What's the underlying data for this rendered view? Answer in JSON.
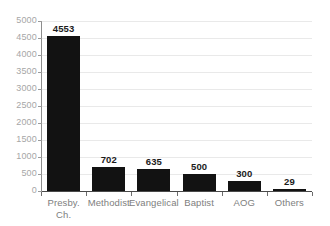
{
  "chart_data": {
    "type": "bar",
    "title": "",
    "xlabel": "",
    "ylabel": "",
    "categories": [
      "Presby. Ch.",
      "Methodist",
      "Evangelical",
      "Baptist",
      "AOG",
      "Others"
    ],
    "category_lines": [
      [
        "Presby.",
        "Ch."
      ],
      [
        "Methodist"
      ],
      [
        "Evangelical"
      ],
      [
        "Baptist"
      ],
      [
        "AOG"
      ],
      [
        "Others"
      ]
    ],
    "values": [
      4553,
      702,
      635,
      500,
      300,
      29
    ],
    "value_labels": [
      "4553",
      "702",
      "635",
      "500",
      "300",
      "29"
    ],
    "ylim": [
      0,
      5000
    ],
    "ytick_step": 500,
    "ytick_labels": [
      "5000",
      "4500",
      "4000",
      "3500",
      "3000",
      "2500",
      "2000",
      "1500",
      "1000",
      "500",
      "0"
    ],
    "ytick_values": [
      5000,
      4500,
      4000,
      3500,
      3000,
      2500,
      2000,
      1500,
      1000,
      500,
      0
    ],
    "grid": true,
    "grid_axis": "y",
    "legend": false,
    "legend_position": "none",
    "bar_color": "#121212",
    "grid_color": "#e9e9e9",
    "axis_color": "#4a4a4a",
    "tick_label_color": "#a6a6a6",
    "category_label_color": "#7e7e7e",
    "value_label_color": "#1b1b1b",
    "background_color": "#ffffff"
  }
}
